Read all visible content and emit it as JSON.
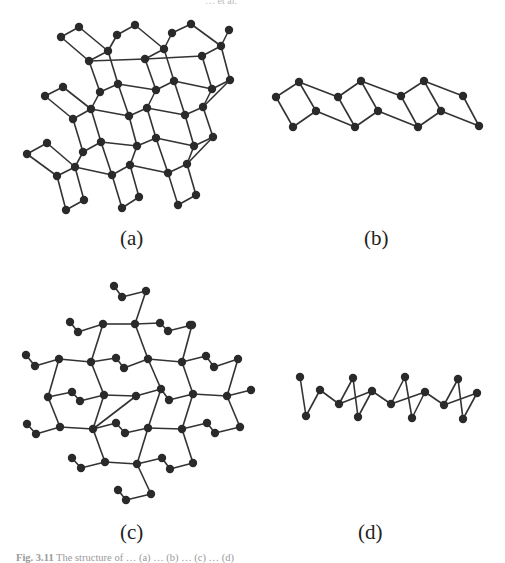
{
  "running_head": {
    "page_number": "",
    "authors": "… et al."
  },
  "figure": {
    "caption_label": "Fig. 3.11",
    "caption_text": "The structure of … (a) … (b) … (c) … (d)",
    "panels": [
      {
        "id": "a",
        "label": "(a)",
        "label_pos": [
          120,
          226
        ]
      },
      {
        "id": "b",
        "label": "(b)",
        "label_pos": [
          364,
          226
        ]
      },
      {
        "id": "c",
        "label": "(c)",
        "label_pos": [
          120,
          520
        ]
      },
      {
        "id": "d",
        "label": "(d)",
        "label_pos": [
          358,
          520
        ]
      }
    ],
    "style": {
      "atom_color": "#2a2a2a",
      "bond_color": "#333333",
      "atom_radius": 4.2,
      "bond_width": 1.6
    }
  },
  "structures": {
    "a": {
      "nodes": [
        [
          61,
          37
        ],
        [
          79,
          27
        ],
        [
          89,
          61
        ],
        [
          108,
          51
        ],
        [
          117,
          35
        ],
        [
          135,
          25
        ],
        [
          145,
          59
        ],
        [
          164,
          49
        ],
        [
          172,
          33
        ],
        [
          191,
          24
        ],
        [
          202,
          56
        ],
        [
          221,
          46
        ],
        [
          229,
          30
        ],
        [
          100,
          92
        ],
        [
          118,
          84
        ],
        [
          156,
          90
        ],
        [
          174,
          81
        ],
        [
          212,
          89
        ],
        [
          230,
          80
        ],
        [
          45,
          96
        ],
        [
          63,
          87
        ],
        [
          73,
          119
        ],
        [
          91,
          109
        ],
        [
          129,
          116
        ],
        [
          147,
          108
        ],
        [
          185,
          115
        ],
        [
          203,
          107
        ],
        [
          83,
          152
        ],
        [
          101,
          142
        ],
        [
          137,
          146
        ],
        [
          156,
          138
        ],
        [
          194,
          146
        ],
        [
          213,
          137
        ],
        [
          27,
          154
        ],
        [
          47,
          143
        ],
        [
          57,
          176
        ],
        [
          75,
          167
        ],
        [
          112,
          175
        ],
        [
          130,
          165
        ],
        [
          168,
          173
        ],
        [
          187,
          164
        ],
        [
          66,
          210
        ],
        [
          84,
          200
        ],
        [
          122,
          208
        ],
        [
          139,
          197
        ],
        [
          178,
          205
        ],
        [
          196,
          195
        ]
      ],
      "bonds": [
        [
          0,
          1
        ],
        [
          0,
          2
        ],
        [
          1,
          3
        ],
        [
          2,
          3
        ],
        [
          3,
          4
        ],
        [
          2,
          6
        ],
        [
          4,
          5
        ],
        [
          5,
          7
        ],
        [
          6,
          7
        ],
        [
          7,
          8
        ],
        [
          6,
          10
        ],
        [
          8,
          9
        ],
        [
          9,
          11
        ],
        [
          10,
          11
        ],
        [
          11,
          12
        ],
        [
          2,
          13
        ],
        [
          3,
          14
        ],
        [
          6,
          15
        ],
        [
          7,
          16
        ],
        [
          10,
          17
        ],
        [
          11,
          18
        ],
        [
          13,
          14
        ],
        [
          15,
          16
        ],
        [
          17,
          18
        ],
        [
          13,
          22
        ],
        [
          14,
          23
        ],
        [
          15,
          24
        ],
        [
          16,
          25
        ],
        [
          17,
          26
        ],
        [
          18,
          26
        ],
        [
          19,
          20
        ],
        [
          19,
          21
        ],
        [
          20,
          22
        ],
        [
          21,
          22
        ],
        [
          22,
          23
        ],
        [
          23,
          24
        ],
        [
          24,
          25
        ],
        [
          25,
          26
        ],
        [
          14,
          15
        ],
        [
          16,
          17
        ],
        [
          21,
          27
        ],
        [
          22,
          28
        ],
        [
          23,
          29
        ],
        [
          24,
          30
        ],
        [
          25,
          31
        ],
        [
          26,
          32
        ],
        [
          27,
          28
        ],
        [
          29,
          30
        ],
        [
          31,
          32
        ],
        [
          27,
          36
        ],
        [
          28,
          37
        ],
        [
          29,
          38
        ],
        [
          30,
          39
        ],
        [
          31,
          40
        ],
        [
          32,
          40
        ],
        [
          33,
          34
        ],
        [
          33,
          35
        ],
        [
          34,
          36
        ],
        [
          35,
          36
        ],
        [
          36,
          37
        ],
        [
          37,
          38
        ],
        [
          38,
          39
        ],
        [
          39,
          40
        ],
        [
          28,
          29
        ],
        [
          30,
          31
        ],
        [
          35,
          41
        ],
        [
          36,
          42
        ],
        [
          37,
          43
        ],
        [
          38,
          44
        ],
        [
          39,
          45
        ],
        [
          40,
          46
        ],
        [
          41,
          42
        ],
        [
          43,
          44
        ],
        [
          45,
          46
        ]
      ]
    },
    "b": {
      "nodes": [
        [
          276,
          97
        ],
        [
          299,
          82
        ],
        [
          316,
          111
        ],
        [
          293,
          127
        ],
        [
          338,
          97
        ],
        [
          361,
          81
        ],
        [
          378,
          111
        ],
        [
          355,
          127
        ],
        [
          401,
          96
        ],
        [
          424,
          81
        ],
        [
          441,
          111
        ],
        [
          418,
          127
        ],
        [
          463,
          96
        ],
        [
          479,
          126
        ]
      ],
      "bonds": [
        [
          0,
          1
        ],
        [
          1,
          2
        ],
        [
          2,
          3
        ],
        [
          3,
          0
        ],
        [
          4,
          5
        ],
        [
          5,
          6
        ],
        [
          6,
          7
        ],
        [
          7,
          4
        ],
        [
          8,
          9
        ],
        [
          9,
          10
        ],
        [
          10,
          11
        ],
        [
          11,
          8
        ],
        [
          1,
          4
        ],
        [
          2,
          7
        ],
        [
          5,
          8
        ],
        [
          6,
          11
        ],
        [
          9,
          12
        ],
        [
          10,
          13
        ],
        [
          12,
          13
        ]
      ]
    },
    "c": {
      "nodes": [
        [
          114,
          286
        ],
        [
          122,
          297
        ],
        [
          146,
          291
        ],
        [
          135,
          324
        ],
        [
          70,
          322
        ],
        [
          78,
          332
        ],
        [
          103,
          324
        ],
        [
          160,
          323
        ],
        [
          168,
          331
        ],
        [
          192,
          325
        ],
        [
          190,
          325
        ],
        [
          26,
          355
        ],
        [
          35,
          366
        ],
        [
          59,
          359
        ],
        [
          91,
          362
        ],
        [
          116,
          358
        ],
        [
          124,
          368
        ],
        [
          148,
          359
        ],
        [
          182,
          362
        ],
        [
          206,
          356
        ],
        [
          214,
          367
        ],
        [
          238,
          359
        ],
        [
          48,
          397
        ],
        [
          72,
          392
        ],
        [
          80,
          401
        ],
        [
          104,
          395
        ],
        [
          136,
          396
        ],
        [
          161,
          389
        ],
        [
          169,
          400
        ],
        [
          193,
          394
        ],
        [
          227,
          396
        ],
        [
          251,
          390
        ],
        [
          27,
          424
        ],
        [
          36,
          434
        ],
        [
          60,
          427
        ],
        [
          93,
          429
        ],
        [
          116,
          423
        ],
        [
          125,
          433
        ],
        [
          148,
          428
        ],
        [
          182,
          429
        ],
        [
          207,
          423
        ],
        [
          215,
          433
        ],
        [
          240,
          427
        ],
        [
          105,
          462
        ],
        [
          72,
          458
        ],
        [
          81,
          468
        ],
        [
          137,
          464
        ],
        [
          162,
          458
        ],
        [
          170,
          469
        ],
        [
          193,
          463
        ],
        [
          118,
          490
        ],
        [
          126,
          500
        ],
        [
          151,
          494
        ]
      ],
      "bonds": [
        [
          0,
          1
        ],
        [
          1,
          2
        ],
        [
          2,
          3
        ],
        [
          4,
          5
        ],
        [
          5,
          6
        ],
        [
          6,
          14
        ],
        [
          3,
          6
        ],
        [
          3,
          7
        ],
        [
          7,
          8
        ],
        [
          8,
          9
        ],
        [
          9,
          18
        ],
        [
          3,
          17
        ],
        [
          11,
          12
        ],
        [
          12,
          13
        ],
        [
          13,
          14
        ],
        [
          14,
          15
        ],
        [
          15,
          16
        ],
        [
          16,
          17
        ],
        [
          17,
          18
        ],
        [
          18,
          19
        ],
        [
          19,
          20
        ],
        [
          20,
          21
        ],
        [
          13,
          22
        ],
        [
          14,
          25
        ],
        [
          17,
          27
        ],
        [
          18,
          29
        ],
        [
          21,
          30
        ],
        [
          22,
          23
        ],
        [
          23,
          24
        ],
        [
          24,
          25
        ],
        [
          25,
          26
        ],
        [
          26,
          27
        ],
        [
          27,
          28
        ],
        [
          28,
          29
        ],
        [
          29,
          30
        ],
        [
          30,
          31
        ],
        [
          22,
          34
        ],
        [
          25,
          35
        ],
        [
          26,
          35
        ],
        [
          27,
          38
        ],
        [
          29,
          39
        ],
        [
          30,
          42
        ],
        [
          32,
          33
        ],
        [
          33,
          34
        ],
        [
          34,
          35
        ],
        [
          35,
          36
        ],
        [
          36,
          37
        ],
        [
          37,
          38
        ],
        [
          38,
          39
        ],
        [
          39,
          40
        ],
        [
          40,
          41
        ],
        [
          41,
          42
        ],
        [
          35,
          43
        ],
        [
          38,
          46
        ],
        [
          39,
          49
        ],
        [
          43,
          46
        ],
        [
          44,
          45
        ],
        [
          45,
          43
        ],
        [
          46,
          47
        ],
        [
          47,
          48
        ],
        [
          48,
          49
        ],
        [
          46,
          52
        ],
        [
          50,
          51
        ],
        [
          51,
          52
        ]
      ]
    },
    "d": {
      "nodes": [
        [
          300,
          377
        ],
        [
          306,
          416
        ],
        [
          320,
          390
        ],
        [
          339,
          404
        ],
        [
          353,
          378
        ],
        [
          358,
          417
        ],
        [
          372,
          391
        ],
        [
          391,
          404
        ],
        [
          405,
          377
        ],
        [
          412,
          418
        ],
        [
          425,
          392
        ],
        [
          444,
          405
        ],
        [
          458,
          379
        ],
        [
          463,
          419
        ],
        [
          477,
          393
        ]
      ],
      "bonds": [
        [
          0,
          1
        ],
        [
          1,
          2
        ],
        [
          2,
          3
        ],
        [
          3,
          4
        ],
        [
          4,
          5
        ],
        [
          3,
          6
        ],
        [
          5,
          6
        ],
        [
          6,
          7
        ],
        [
          7,
          8
        ],
        [
          8,
          9
        ],
        [
          7,
          10
        ],
        [
          9,
          10
        ],
        [
          10,
          11
        ],
        [
          11,
          12
        ],
        [
          12,
          13
        ],
        [
          11,
          14
        ],
        [
          13,
          14
        ]
      ]
    }
  }
}
